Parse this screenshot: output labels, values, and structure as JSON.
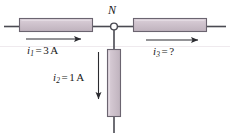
{
  "figure": {
    "type": "circuit-schematic",
    "background_color": "#ffffff",
    "wire_color": "#4a4a52",
    "resistor_fill": "#c9bcc6",
    "resistor_fill_light": "#d8cdd6",
    "resistor_stroke": "#6b6470",
    "label_color": "#181818"
  },
  "node": {
    "label": "N",
    "marker": "open-circle",
    "x": 114,
    "y": 27
  },
  "branches": [
    {
      "id": "branch-1",
      "name": "left-branch",
      "orientation": "horizontal",
      "current_symbol": "i",
      "current_subscript": "1",
      "equals": "=",
      "current_value": "3",
      "current_unit": "A",
      "label_text": "i1 = 3 A",
      "arrow_direction": "right",
      "resistor": {
        "x": 19,
        "y": 18,
        "w": 74,
        "h": 14
      }
    },
    {
      "id": "branch-2",
      "name": "bottom-branch",
      "orientation": "vertical",
      "current_symbol": "i",
      "current_subscript": "2",
      "equals": "=",
      "current_value": "1",
      "current_unit": "A",
      "label_text": "i2 = 1 A",
      "arrow_direction": "down",
      "resistor": {
        "x": 107,
        "y": 48,
        "w": 14,
        "h": 70
      }
    },
    {
      "id": "branch-3",
      "name": "right-branch",
      "orientation": "horizontal",
      "current_symbol": "i",
      "current_subscript": "3",
      "equals": "=",
      "current_value": "?",
      "current_unit": "",
      "label_text": "i3 = ?",
      "arrow_direction": "right",
      "resistor": {
        "x": 133,
        "y": 18,
        "w": 75,
        "h": 14
      }
    }
  ]
}
